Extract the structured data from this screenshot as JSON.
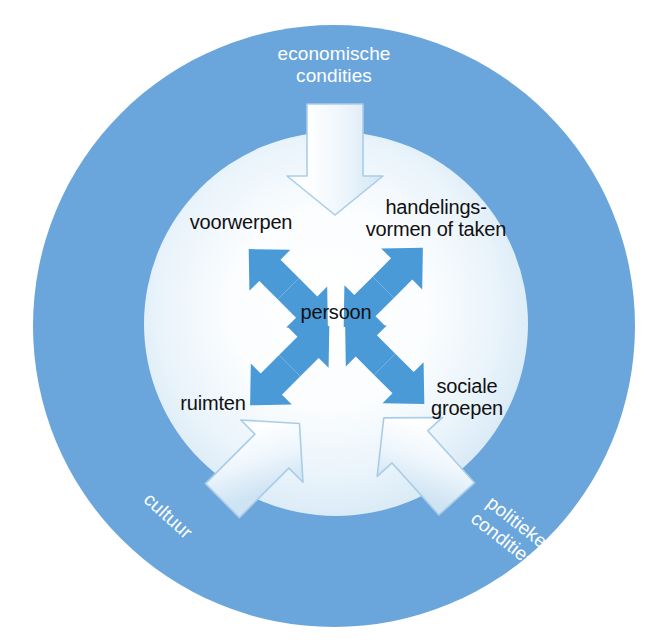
{
  "diagram": {
    "colors": {
      "ring_blue": "#6aa6dc",
      "ring_blue_dark": "#5b9bd5",
      "arrow_blue": "#4a9ad8",
      "inner_light": "#dbeaf5",
      "inner_center": "#ffffff",
      "block_arrow_fill": "#eef5fb",
      "block_arrow_stroke": "#a9cde8",
      "label_text": "#111111",
      "ring_text": "#ffffff",
      "page_background": "#ffffff"
    },
    "ring_labels": [
      {
        "id": "economische",
        "text": "economische\ncondities",
        "position": "top",
        "rotation": 0
      },
      {
        "id": "cultuur",
        "text": "cultuur",
        "position": "bottom-left",
        "rotation": 42
      },
      {
        "id": "politieke",
        "text": "politieke\ncondities",
        "position": "bottom-right",
        "rotation": 38
      }
    ],
    "center_label": {
      "id": "persoon",
      "text": "persoon"
    },
    "inner_labels": [
      {
        "id": "voorwerpen",
        "text": "voorwerpen",
        "position": "top-left"
      },
      {
        "id": "handelingsvormen",
        "text": "handelings-\nvormen of taken",
        "position": "top-right"
      },
      {
        "id": "ruimten",
        "text": "ruimten",
        "position": "bottom-left"
      },
      {
        "id": "sociale-groepen",
        "text": "sociale\ngroepen",
        "position": "bottom-right"
      }
    ],
    "connectors": [
      {
        "id": "persoon-voorwerpen",
        "type": "double-headed-arrow",
        "from": "persoon",
        "to": "voorwerpen"
      },
      {
        "id": "persoon-handelingsvormen",
        "type": "double-headed-arrow",
        "from": "persoon",
        "to": "handelingsvormen"
      },
      {
        "id": "persoon-ruimten",
        "type": "double-headed-arrow",
        "from": "persoon",
        "to": "ruimten"
      },
      {
        "id": "persoon-sociale-groepen",
        "type": "double-headed-arrow",
        "from": "persoon",
        "to": "sociale-groepen"
      }
    ],
    "block_arrows": [
      {
        "id": "economische-arrow",
        "label": "economische condities",
        "direction": "down",
        "points_to": "inner-circle"
      },
      {
        "id": "cultuur-arrow",
        "label": "cultuur",
        "direction": "up-right",
        "points_to": "inner-circle"
      },
      {
        "id": "politieke-arrow",
        "label": "politieke condities",
        "direction": "up-left",
        "points_to": "inner-circle"
      }
    ]
  }
}
